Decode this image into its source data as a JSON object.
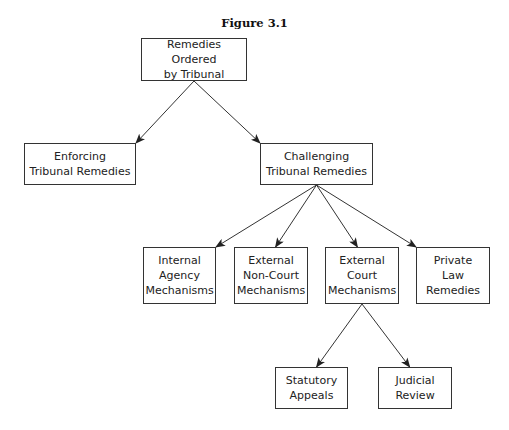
{
  "figure": {
    "title": "Figure 3.1"
  },
  "nodes": {
    "root": "Remedies Ordered\nby Tribunal",
    "enforcing": "Enforcing\nTribunal Remedies",
    "challenging": "Challenging\nTribunal Remedies",
    "internal_agency": "Internal\nAgency\nMechanisms",
    "external_non_court": "External\nNon-Court\nMechanisms",
    "external_court": "External\nCourt\nMechanisms",
    "private_law": "Private\nLaw\nRemedies",
    "statutory_appeals": "Statutory\nAppeals",
    "judicial_review": "Judicial\nReview"
  },
  "edges": [
    [
      "root",
      "enforcing"
    ],
    [
      "root",
      "challenging"
    ],
    [
      "challenging",
      "internal_agency"
    ],
    [
      "challenging",
      "external_non_court"
    ],
    [
      "challenging",
      "external_court"
    ],
    [
      "challenging",
      "private_law"
    ],
    [
      "external_court",
      "statutory_appeals"
    ],
    [
      "external_court",
      "judicial_review"
    ]
  ]
}
